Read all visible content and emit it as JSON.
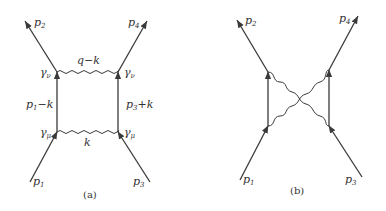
{
  "diagram_a": {
    "caption": "(a)",
    "external_lines": {
      "p1": {
        "base": "p",
        "sub": "1"
      },
      "p2": {
        "base": "p",
        "sub": "2"
      },
      "p3": {
        "base": "p",
        "sub": "3"
      },
      "p4": {
        "base": "p",
        "sub": "4"
      }
    },
    "internal_labels": {
      "top_photon": "q−k",
      "bottom_photon": "k",
      "left_fermion": {
        "base": "p",
        "sub": "1",
        "rest": "−k"
      },
      "right_fermion": {
        "base": "p",
        "sub": "3",
        "rest": "+k"
      }
    },
    "vertices": {
      "top_left": {
        "base": "γ",
        "sub": "ν"
      },
      "top_right": {
        "base": "γ",
        "sub": "ν"
      },
      "bottom_left": {
        "base": "γ",
        "sub": "μ"
      },
      "bottom_right": {
        "base": "γ",
        "sub": "μ"
      }
    }
  },
  "diagram_b": {
    "caption": "(b)",
    "external_lines": {
      "p1": {
        "base": "p",
        "sub": "1"
      },
      "p2": {
        "base": "p",
        "sub": "2"
      },
      "p3": {
        "base": "p",
        "sub": "3"
      },
      "p4": {
        "base": "p",
        "sub": "4"
      }
    }
  },
  "colors": {
    "line": "#3a3a3a",
    "text": "#333333",
    "background": "#ffffff"
  }
}
